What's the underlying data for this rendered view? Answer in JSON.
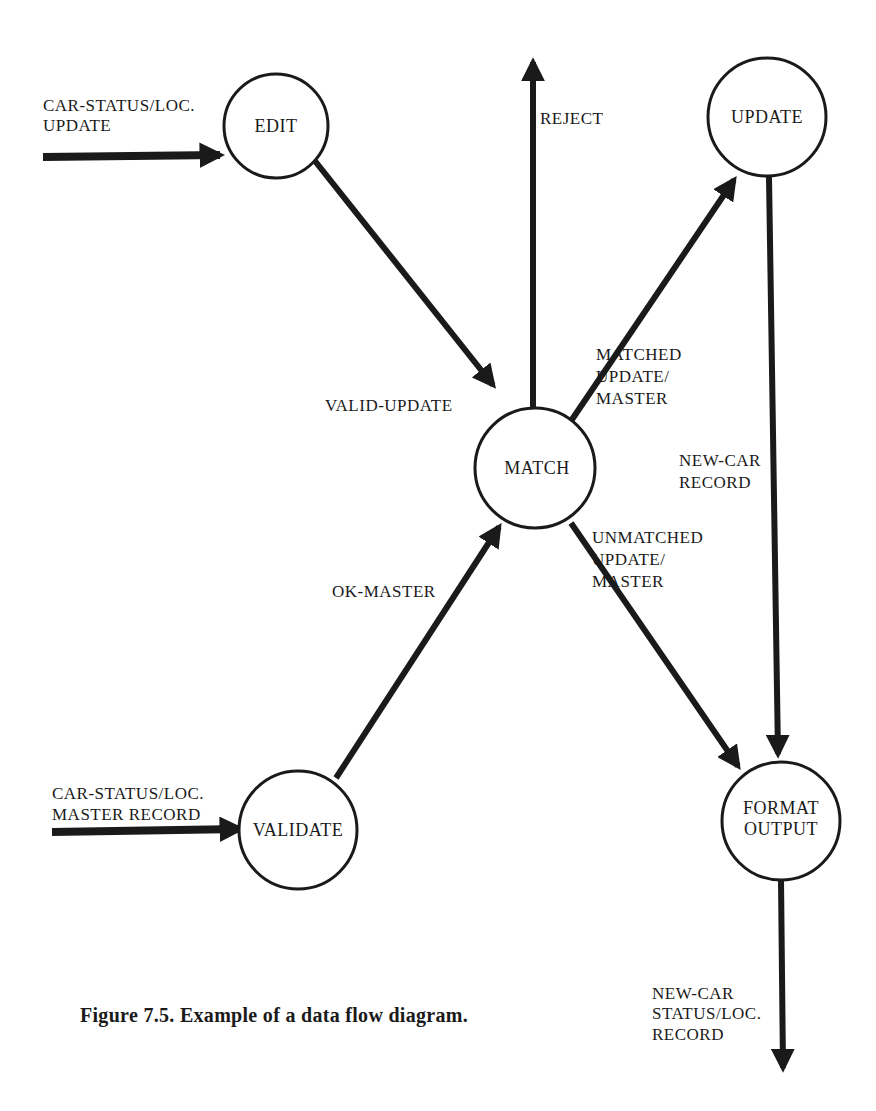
{
  "figure": {
    "caption": "Figure 7.5.  Example of a data flow diagram."
  },
  "processes": {
    "edit": "EDIT",
    "update": "UPDATE",
    "match": "MATCH",
    "validate": "VALIDATE",
    "format_output_line1": "FORMAT",
    "format_output_line2": "OUTPUT"
  },
  "flows": {
    "car_status_update": [
      "CAR-STATUS/LOC.",
      "UPDATE"
    ],
    "car_status_master": [
      "CAR-STATUS/LOC.",
      "MASTER RECORD"
    ],
    "valid_update": "VALID-UPDATE",
    "ok_master": "OK-MASTER",
    "reject": "REJECT",
    "matched": [
      "MATCHED",
      "UPDATE/",
      "MASTER"
    ],
    "unmatched": [
      "UNMATCHED",
      "UPDATE/",
      "MASTER"
    ],
    "new_car_record": [
      "NEW-CAR",
      "RECORD"
    ],
    "new_car_status": [
      "NEW-CAR",
      "STATUS/LOC.",
      "RECORD"
    ]
  },
  "colors": {
    "ink": "#1a1a1a",
    "paper": "#ffffff"
  }
}
